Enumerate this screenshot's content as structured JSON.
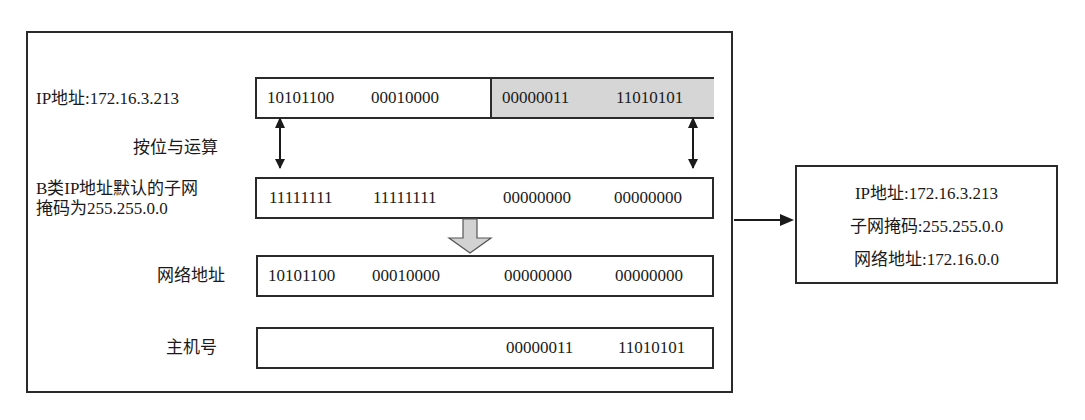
{
  "diagram": {
    "labels": {
      "ip": "IP地址:172.16.3.213",
      "and_op": "按位与运算",
      "mask_line1": "B类IP地址默认的子网",
      "mask_line2": "掩码为255.255.0.0",
      "network": "网络地址",
      "host": "主机号"
    },
    "rows": {
      "ip": [
        "10101100",
        "00010000",
        "00000011",
        "11010101"
      ],
      "mask": [
        "11111111",
        "11111111",
        "00000000",
        "00000000"
      ],
      "network": [
        "10101100",
        "00010000",
        "00000000",
        "00000000"
      ],
      "host": [
        "",
        "",
        "00000011",
        "11010101"
      ]
    },
    "highlight_color": "#d6d6d6",
    "result": {
      "ip": "IP地址:172.16.3.213",
      "mask": "子网掩码:255.255.0.0",
      "network": "网络地址:172.16.0.0"
    }
  }
}
